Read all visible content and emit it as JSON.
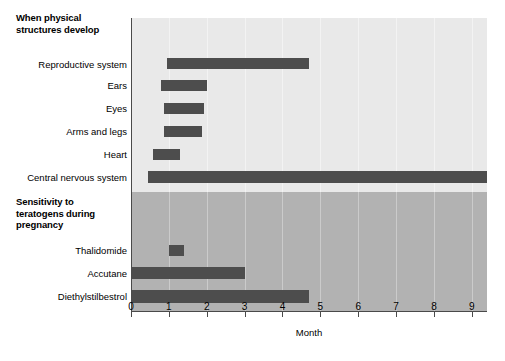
{
  "chart_data": {
    "type": "bar",
    "subtype": "horizontal-gantt-range",
    "title": "",
    "xlabel": "Month",
    "ylabel": "",
    "xlim": [
      0,
      9.4
    ],
    "xticks": [
      0,
      1,
      2,
      3,
      4,
      5,
      6,
      7,
      8,
      9
    ],
    "xtick_labels": [
      "0",
      "1",
      "2",
      "3",
      "4",
      "5",
      "6",
      "7",
      "8",
      "9"
    ],
    "grid": true,
    "legend": "none",
    "sections": [
      {
        "heading": "When physical\nstructures develop",
        "background_color": "#e9e9e9",
        "categories": [
          "Reproductive system",
          "Ears",
          "Eyes",
          "Arms and legs",
          "Heart",
          "Central nervous system"
        ],
        "bars": [
          {
            "label": "Reproductive system",
            "start": 0.95,
            "end": 4.7
          },
          {
            "label": "Ears",
            "start": 0.8,
            "end": 2.0
          },
          {
            "label": "Eyes",
            "start": 0.88,
            "end": 1.93
          },
          {
            "label": "Arms and legs",
            "start": 0.88,
            "end": 1.88
          },
          {
            "label": "Heart",
            "start": 0.58,
            "end": 1.3
          },
          {
            "label": "Central nervous system",
            "start": 0.45,
            "end": 9.4
          }
        ]
      },
      {
        "heading": "Sensitivity to\nteratogens during\npregnancy",
        "background_color": "#b2b2b2",
        "categories": [
          "Thalidomide",
          "Accutane",
          "Diethylstilbestrol"
        ],
        "bars": [
          {
            "label": "Thalidomide",
            "start": 1.0,
            "end": 1.4
          },
          {
            "label": "Accutane",
            "start": 0.0,
            "end": 3.0
          },
          {
            "label": "Diethylstilbestrol",
            "start": 0.0,
            "end": 4.7
          }
        ]
      }
    ],
    "bar_color": "#4d4d4d"
  },
  "headings": {
    "physical": "When physical\nstructures develop",
    "sensitivity": "Sensitivity to\nteratogens during\npregnancy"
  },
  "row_labels": {
    "reproductive_system": "Reproductive system",
    "ears": "Ears",
    "eyes": "Eyes",
    "arms_and_legs": "Arms and legs",
    "heart": "Heart",
    "central_nervous_system": "Central nervous system",
    "thalidomide": "Thalidomide",
    "accutane": "Accutane",
    "diethylstilbestrol": "Diethylstilbestrol"
  },
  "axis": {
    "x_title": "Month",
    "ticks": [
      "0",
      "1",
      "2",
      "3",
      "4",
      "5",
      "6",
      "7",
      "8",
      "9"
    ]
  },
  "colors": {
    "bar": "#4d4d4d",
    "band_top": "#e9e9e9",
    "band_bottom": "#b2b2b2",
    "axis": "#4a4a4a",
    "text": "#000000"
  }
}
